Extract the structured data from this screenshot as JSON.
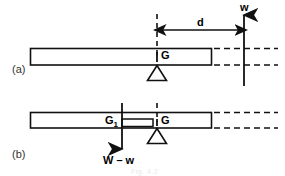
{
  "figure": {
    "panels": [
      {
        "id": "a",
        "label": "(a)"
      },
      {
        "id": "b",
        "label": "(b)"
      }
    ],
    "annotations": {
      "centroid_a": "G",
      "centroid_b": "G",
      "centroid_b_left": "G",
      "centroid_b_left_sub": "1",
      "distance": "d",
      "force_up": "w",
      "force_down": "W – w"
    },
    "caption": "Fig. 4.2",
    "colors": {
      "line": "#111111",
      "background": "#ffffff",
      "text": "#000000",
      "panel_label": "#333333",
      "caption": "#e9e9e9"
    },
    "geometry": {
      "beam_a": {
        "x": 30,
        "y": 48,
        "width": 182,
        "height": 17
      },
      "beam_b": {
        "x": 30,
        "y": 112,
        "width": 182,
        "height": 16
      },
      "dashed_extension_end_x": 278,
      "fulcrum_x": 157,
      "force_up_x": 244,
      "force_down_x": 122,
      "dimension_y": 30
    }
  }
}
